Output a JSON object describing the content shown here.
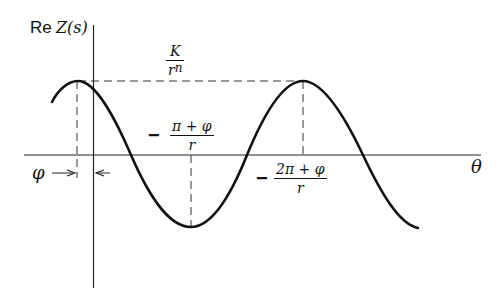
{
  "diagram": {
    "type": "function-plot",
    "y_axis_label": {
      "prefix": "Re",
      "func": "Z(s)"
    },
    "x_axis_label": "θ",
    "amplitude_label": {
      "numerator": "K",
      "denominator": "r",
      "exponent": "n"
    },
    "trough_label": {
      "sign": "−",
      "numerator": "π + φ",
      "denominator": "r"
    },
    "second_peak_label": {
      "sign": "−",
      "numerator": "2π + φ",
      "denominator": "r"
    },
    "phase_label": "φ",
    "curve": "cosine wave (K/rⁿ)·cos(rθ + φ)",
    "colors": {
      "ink": "#111111",
      "background": "#ffffff"
    }
  }
}
